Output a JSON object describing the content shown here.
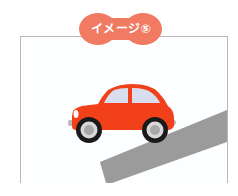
{
  "badge": {
    "label": "イメージ⑤",
    "color": "#F07A62"
  },
  "illustration": {
    "subject": "car-on-slope",
    "car_color": "#F2401A",
    "window_color": "#D9DEEE",
    "ramp_color": "#9B9B9B",
    "frame_border_color": "#B8B8B8"
  }
}
